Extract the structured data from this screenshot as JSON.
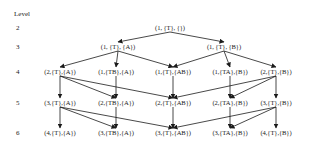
{
  "diagram": {
    "level_header": "Level",
    "levels": [
      {
        "num": "2",
        "y": 24
      },
      {
        "num": "3",
        "y": 43
      },
      {
        "num": "4",
        "y": 68
      },
      {
        "num": "5",
        "y": 99
      },
      {
        "num": "6",
        "y": 129
      }
    ],
    "nodes": [
      {
        "id": "n2_0",
        "label": "(1, {T}, {})",
        "x": 170,
        "y": 24
      },
      {
        "id": "n3_0",
        "label": "(1, {T}, {A})",
        "x": 118,
        "y": 43
      },
      {
        "id": "n3_1",
        "label": "(1, {T}, {B})",
        "x": 224,
        "y": 43
      },
      {
        "id": "n4_0",
        "label": "(2,{T},{A})",
        "x": 60,
        "y": 68
      },
      {
        "id": "n4_1",
        "label": "(1,{TB},{A})",
        "x": 116,
        "y": 68
      },
      {
        "id": "n4_2",
        "label": "(1,{T},{AB})",
        "x": 173,
        "y": 68
      },
      {
        "id": "n4_3",
        "label": "(1,{TA},{B})",
        "x": 230,
        "y": 68
      },
      {
        "id": "n4_4",
        "label": "(2,{T},{B})",
        "x": 276,
        "y": 68
      },
      {
        "id": "n5_0",
        "label": "(3,{T},{A})",
        "x": 60,
        "y": 99
      },
      {
        "id": "n5_1",
        "label": "(2,{TB},{A})",
        "x": 116,
        "y": 99
      },
      {
        "id": "n5_2",
        "label": "(2,{T},{AB})",
        "x": 173,
        "y": 99
      },
      {
        "id": "n5_3",
        "label": "(2,{TA},{B})",
        "x": 230,
        "y": 99
      },
      {
        "id": "n5_4",
        "label": "(3,{T},{B})",
        "x": 276,
        "y": 99
      },
      {
        "id": "n6_0",
        "label": "(4,{T},{A})",
        "x": 60,
        "y": 129
      },
      {
        "id": "n6_1",
        "label": "(3,{TB},{A})",
        "x": 116,
        "y": 129
      },
      {
        "id": "n6_2",
        "label": "(3,{T},{AB})",
        "x": 173,
        "y": 129
      },
      {
        "id": "n6_3",
        "label": "(3,{TA},{B})",
        "x": 230,
        "y": 129
      },
      {
        "id": "n6_4",
        "label": "(4,{T},{B})",
        "x": 276,
        "y": 129
      }
    ],
    "edges": [
      [
        "n2_0",
        "n3_0"
      ],
      [
        "n2_0",
        "n3_1"
      ],
      [
        "n3_0",
        "n4_0"
      ],
      [
        "n3_0",
        "n4_1"
      ],
      [
        "n3_0",
        "n4_2"
      ],
      [
        "n3_1",
        "n4_2"
      ],
      [
        "n3_1",
        "n4_3"
      ],
      [
        "n3_1",
        "n4_4"
      ],
      [
        "n4_0",
        "n5_0"
      ],
      [
        "n4_0",
        "n5_1"
      ],
      [
        "n4_0",
        "n5_2"
      ],
      [
        "n4_1",
        "n5_1"
      ],
      [
        "n4_2",
        "n5_2"
      ],
      [
        "n4_3",
        "n5_3"
      ],
      [
        "n4_4",
        "n5_2"
      ],
      [
        "n4_4",
        "n5_3"
      ],
      [
        "n4_4",
        "n5_4"
      ],
      [
        "n5_0",
        "n6_0"
      ],
      [
        "n5_0",
        "n6_1"
      ],
      [
        "n5_0",
        "n6_2"
      ],
      [
        "n5_1",
        "n6_1"
      ],
      [
        "n5_2",
        "n6_2"
      ],
      [
        "n5_3",
        "n6_3"
      ],
      [
        "n5_4",
        "n6_2"
      ],
      [
        "n5_4",
        "n6_3"
      ],
      [
        "n5_4",
        "n6_4"
      ]
    ]
  }
}
